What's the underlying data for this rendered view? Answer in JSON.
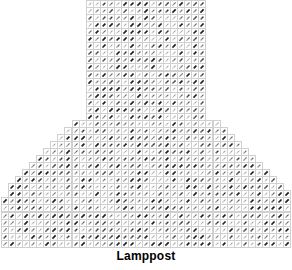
{
  "figure": {
    "caption": "Lamppost",
    "type": "quiver-shape-mask"
  },
  "style": {
    "grid_color": "#d0d0d0",
    "arrow_color": "#1a1a1a",
    "background": "#ffffff",
    "cell_size": 7.05,
    "arrow_angle_deg": 45
  },
  "chart_data": {
    "type": "heatmap",
    "title": "",
    "xlabel": "",
    "ylabel": "",
    "annotations": [
      "Lamppost"
    ],
    "grid": true,
    "legend": "none",
    "cols": 41,
    "rows": 35,
    "col_origin_px": 1,
    "row_origin_px": 0,
    "post": {
      "col_start": 12,
      "col_end": 28,
      "row_start": 0,
      "row_end": 16
    },
    "flare": {
      "row_start": 17,
      "row_end": 34,
      "step_cols_per_row": 1
    },
    "row_spans": [
      [
        12,
        28
      ],
      [
        12,
        28
      ],
      [
        12,
        28
      ],
      [
        12,
        28
      ],
      [
        12,
        28
      ],
      [
        12,
        28
      ],
      [
        12,
        28
      ],
      [
        12,
        28
      ],
      [
        12,
        28
      ],
      [
        12,
        28
      ],
      [
        12,
        28
      ],
      [
        12,
        28
      ],
      [
        12,
        28
      ],
      [
        12,
        28
      ],
      [
        12,
        28
      ],
      [
        12,
        28
      ],
      [
        12,
        28
      ],
      [
        10,
        30
      ],
      [
        9,
        31
      ],
      [
        8,
        32
      ],
      [
        7,
        33
      ],
      [
        6,
        34
      ],
      [
        5,
        35
      ],
      [
        4,
        36
      ],
      [
        3,
        37
      ],
      [
        2,
        38
      ],
      [
        1,
        39
      ],
      [
        1,
        40
      ],
      [
        0,
        40
      ],
      [
        0,
        40
      ],
      [
        0,
        40
      ],
      [
        0,
        40
      ],
      [
        0,
        40
      ],
      [
        0,
        40
      ],
      [
        0,
        40
      ]
    ],
    "arrow_angles_deg": 45,
    "darkness_levels": [
      0.25,
      0.45,
      0.7,
      0.95
    ]
  }
}
